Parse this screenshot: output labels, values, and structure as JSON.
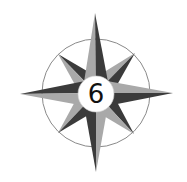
{
  "compass": {
    "badge_number": "6",
    "colors": {
      "dark": "#3b3b3b",
      "light": "#a9a9a9",
      "ring": "#8a8a8a",
      "center_fill": "#ffffff",
      "text": "#111111"
    },
    "points": [
      "N",
      "NE",
      "E",
      "SE",
      "S",
      "SW",
      "W",
      "NW"
    ]
  }
}
